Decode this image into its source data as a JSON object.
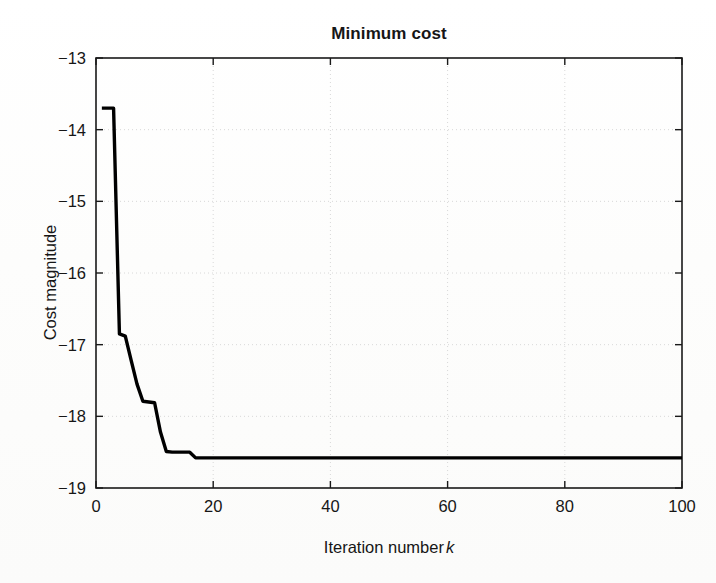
{
  "chart_data": {
    "type": "line",
    "title": "Minimum cost",
    "xlabel_parts": {
      "text": "Iteration number",
      "symbol": "k"
    },
    "xlabel": "Iteration number k",
    "ylabel": "Cost magnitude",
    "xlim": [
      0,
      100
    ],
    "ylim": [
      -19,
      -13
    ],
    "xticks": [
      0,
      20,
      40,
      60,
      80,
      100
    ],
    "xtick_labels": [
      "0",
      "20",
      "40",
      "60",
      "80",
      "100"
    ],
    "yticks": [
      -13,
      -14,
      -15,
      -16,
      -17,
      -18,
      -19
    ],
    "ytick_labels": [
      "−13",
      "−14",
      "−15",
      "−16",
      "−17",
      "−18",
      "−19"
    ],
    "grid": true,
    "grid_style": "dotted",
    "legend": null,
    "line_color": "#000000",
    "line_width": 3.4,
    "series": [
      {
        "name": "Minimum cost",
        "x": [
          1,
          2,
          3,
          4,
          5,
          6,
          7,
          8,
          9,
          10,
          11,
          12,
          13,
          14,
          15,
          16,
          17,
          18,
          19,
          20,
          25,
          30,
          35,
          40,
          45,
          50,
          55,
          60,
          65,
          70,
          75,
          80,
          85,
          90,
          95,
          100
        ],
        "values": [
          -13.7,
          -13.7,
          -13.7,
          -16.85,
          -16.88,
          -17.22,
          -17.55,
          -17.79,
          -17.8,
          -17.81,
          -18.22,
          -18.49,
          -18.5,
          -18.5,
          -18.5,
          -18.5,
          -18.58,
          -18.58,
          -18.58,
          -18.58,
          -18.58,
          -18.58,
          -18.58,
          -18.58,
          -18.58,
          -18.58,
          -18.58,
          -18.58,
          -18.58,
          -18.58,
          -18.58,
          -18.58,
          -18.58,
          -18.58,
          -18.58,
          -18.58
        ]
      }
    ],
    "annotations": []
  },
  "figure": {
    "title": "Minimum cost",
    "y_axis_title": "Cost magnitude",
    "x_axis_title": "Iteration number",
    "x_axis_symbol": "k",
    "background_color": "#fefefe",
    "axis_color": "#1a1a1a",
    "grid_color": "#d8d8d8"
  }
}
